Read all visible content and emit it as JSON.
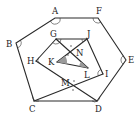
{
  "figure": {
    "points": {
      "A": {
        "x": 55,
        "y": 18,
        "lx": 52,
        "ly": 14
      },
      "F": {
        "x": 98,
        "y": 18,
        "lx": 96,
        "ly": 14
      },
      "B": {
        "x": 16,
        "y": 43,
        "lx": 6,
        "ly": 47
      },
      "E": {
        "x": 126,
        "y": 60,
        "lx": 128,
        "ly": 63
      },
      "C": {
        "x": 34,
        "y": 101,
        "lx": 29,
        "ly": 112
      },
      "D": {
        "x": 97,
        "y": 101,
        "lx": 95,
        "ly": 112
      },
      "G": {
        "x": 56,
        "y": 39,
        "lx": 50,
        "ly": 37
      },
      "J": {
        "x": 87,
        "y": 39,
        "lx": 87,
        "ly": 37
      },
      "H": {
        "x": 36,
        "y": 61,
        "lx": 27,
        "ly": 64
      },
      "I": {
        "x": 103,
        "y": 74,
        "lx": 105,
        "ly": 77
      },
      "K": {
        "x": 57,
        "y": 62,
        "lx": 48,
        "ly": 65
      },
      "L": {
        "x": 88,
        "y": 68,
        "lx": 84,
        "ly": 78
      },
      "N": {
        "x": 71,
        "y": 51,
        "lx": 76,
        "ly": 56
      },
      "M": {
        "x": 73,
        "y": 86,
        "lx": 61,
        "ly": 86
      }
    },
    "labels": [
      "A",
      "B",
      "C",
      "D",
      "E",
      "F",
      "G",
      "H",
      "I",
      "J",
      "K",
      "L",
      "M",
      "N"
    ],
    "segments": [
      [
        "A",
        "F"
      ],
      [
        "F",
        "E"
      ],
      [
        "E",
        "D"
      ],
      [
        "D",
        "C"
      ],
      [
        "C",
        "B"
      ],
      [
        "B",
        "A"
      ],
      [
        "G",
        "J"
      ],
      [
        "J",
        "I"
      ],
      [
        "G",
        "H"
      ],
      [
        "H",
        "D"
      ],
      [
        "C",
        "I"
      ],
      [
        "G",
        "L"
      ],
      [
        "J",
        "K"
      ],
      [
        "K",
        "L"
      ]
    ]
  }
}
